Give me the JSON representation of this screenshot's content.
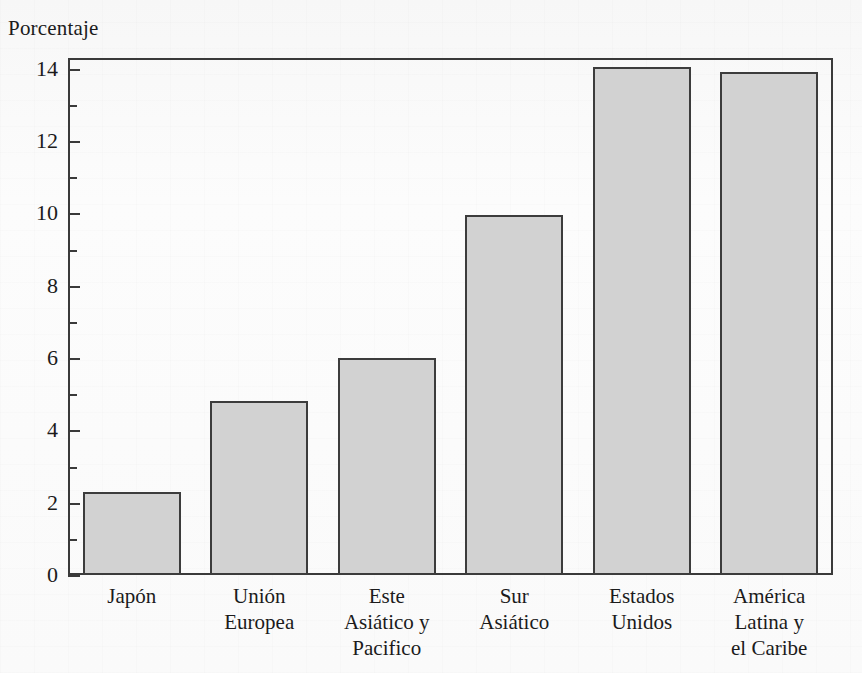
{
  "chart_data": {
    "type": "bar",
    "title": "",
    "ylabel": "Porcentaje",
    "xlabel": "",
    "categories": [
      "Japón",
      "Unión Europea",
      "Este Asiático y Pacifico",
      "Sur Asiático",
      "Estados Unidos",
      "América Latina y el Caribe"
    ],
    "category_lines": [
      [
        "Japón"
      ],
      [
        "Unión",
        "Europea"
      ],
      [
        "Este",
        "Asiático y",
        "Pacifico"
      ],
      [
        "Sur",
        "Asiático"
      ],
      [
        "Estados",
        "Unidos"
      ],
      [
        "América",
        "Latina y",
        "el Caribe"
      ]
    ],
    "values": [
      2.3,
      4.8,
      6.0,
      9.95,
      14.05,
      13.9
    ],
    "ylim": [
      0,
      14.3
    ],
    "yticks": [
      0,
      2,
      4,
      6,
      8,
      10,
      12,
      14
    ],
    "ytick_labels": [
      "0",
      "2",
      "4",
      "6",
      "8",
      "10",
      "12",
      "14"
    ],
    "yticks_minor": [
      1,
      3,
      5,
      7,
      9,
      11,
      13
    ],
    "grid": false,
    "legend": false,
    "bar_color": "#d2d2d2",
    "bar_edge_color": "#3c3c3c",
    "axis_color": "#3a3a3a",
    "background_color": "#fbfbfb"
  }
}
